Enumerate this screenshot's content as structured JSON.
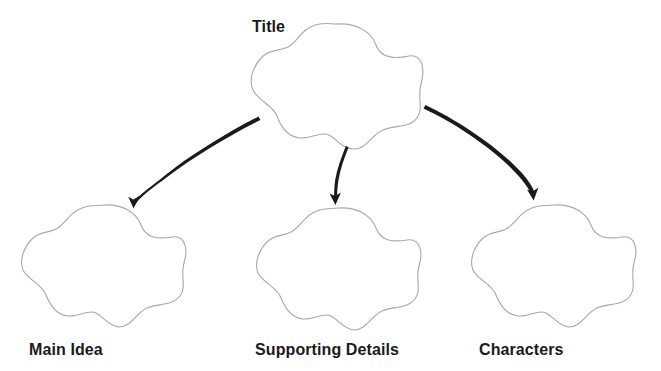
{
  "diagram": {
    "type": "graphic-organizer",
    "background_color": "#ffffff",
    "shape_outline_color": "#a8a8a8",
    "arrow_color": "#1a1a1a",
    "label_color": "#1a1a1a",
    "nodes": [
      {
        "id": "title",
        "label": "Title",
        "shape": "five-lobed-flower",
        "center_x": 337,
        "center_y": 87,
        "radius_x": 88,
        "radius_y": 63,
        "label_position": "top-left-outside"
      },
      {
        "id": "main-idea",
        "label": "Main Idea",
        "shape": "five-lobed-flower",
        "center_x": 102,
        "center_y": 267,
        "radius_x": 85,
        "radius_y": 63,
        "label_position": "bottom-outside"
      },
      {
        "id": "supporting-details",
        "label": "Supporting Details",
        "shape": "five-lobed-flower",
        "center_x": 337,
        "center_y": 270,
        "radius_x": 85,
        "radius_y": 63,
        "label_position": "bottom-outside"
      },
      {
        "id": "characters",
        "label": "Characters",
        "shape": "five-lobed-flower",
        "center_x": 552,
        "center_y": 267,
        "radius_x": 85,
        "radius_y": 63,
        "label_position": "bottom-outside"
      }
    ],
    "connectors": [
      {
        "id": "arrow-title-to-main-idea",
        "from": "title",
        "to": "main-idea",
        "style": "hand-drawn-curved-tapered",
        "direction": "down-left"
      },
      {
        "id": "arrow-title-to-supporting-details",
        "from": "title",
        "to": "supporting-details",
        "style": "hand-drawn-curved-tapered",
        "direction": "down"
      },
      {
        "id": "arrow-title-to-characters",
        "from": "title",
        "to": "characters",
        "style": "hand-drawn-curved-tapered",
        "direction": "down-right"
      }
    ]
  }
}
